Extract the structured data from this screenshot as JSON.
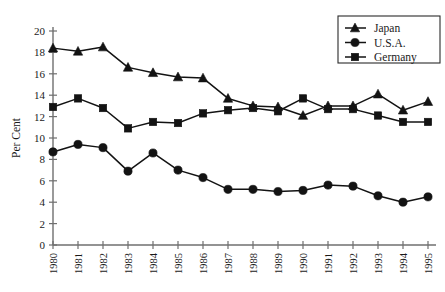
{
  "chart_data": {
    "type": "line",
    "title": "",
    "xlabel": "",
    "ylabel": "Per Cent",
    "categories": [
      "1980",
      "1981",
      "1982",
      "1983",
      "1984",
      "1985",
      "1986",
      "1987",
      "1988",
      "1989",
      "1990",
      "1991",
      "1992",
      "1993",
      "1994",
      "1995"
    ],
    "ylim": [
      0,
      20
    ],
    "ytick_step": 2,
    "yticks": [
      "0",
      "2",
      "4",
      "6",
      "8",
      "10",
      "12",
      "14",
      "16",
      "18",
      "20"
    ],
    "grid": false,
    "legend_position": "top-right",
    "series": [
      {
        "name": "Japan",
        "marker": "triangle",
        "color": "#131313",
        "values": [
          18.4,
          18.1,
          18.5,
          16.6,
          16.1,
          15.7,
          15.6,
          13.7,
          13.0,
          12.9,
          12.1,
          13.0,
          13.0,
          14.1,
          12.6,
          13.4
        ]
      },
      {
        "name": "U.S.A.",
        "marker": "circle",
        "color": "#131313",
        "values": [
          8.7,
          9.4,
          9.1,
          6.9,
          8.6,
          7.0,
          6.3,
          5.2,
          5.2,
          5.0,
          5.1,
          5.6,
          5.5,
          4.6,
          4.0,
          4.5
        ]
      },
      {
        "name": "Germany",
        "marker": "square",
        "color": "#131313",
        "values": [
          12.9,
          13.7,
          12.8,
          10.9,
          11.5,
          11.4,
          12.3,
          12.6,
          12.8,
          12.5,
          13.7,
          12.7,
          12.7,
          12.1,
          11.5,
          11.5
        ]
      }
    ]
  },
  "axis": {
    "y_title": "Per Cent"
  }
}
